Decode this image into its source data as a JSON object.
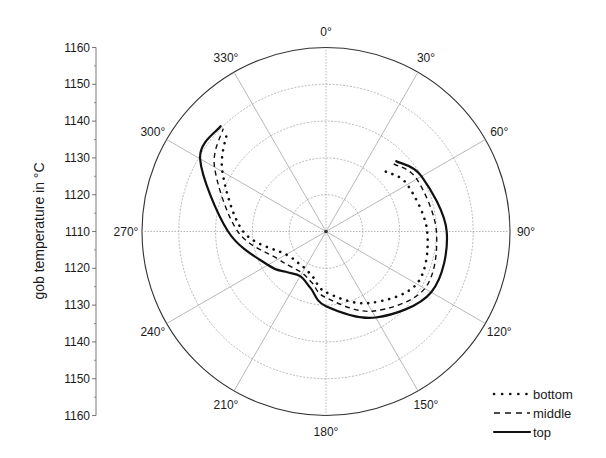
{
  "chart_data": {
    "type": "polar-line",
    "title": "",
    "ylabel": "gob temperature in °C",
    "radial_axis": {
      "center_value": 1110,
      "outer_value": 1160,
      "ticks": [
        1110,
        1120,
        1130,
        1140,
        1150,
        1160
      ],
      "left_axis_labels_top_to_bottom": [
        "1160",
        "1150",
        "1140",
        "1130",
        "1120",
        "1110",
        "1120",
        "1130",
        "1140",
        "1150",
        "1160"
      ]
    },
    "angular_axis": {
      "direction": "clockwise",
      "zero": "top",
      "labels": [
        "0°",
        "30°",
        "60°",
        "90°",
        "120°",
        "150°",
        "180°",
        "210°",
        "240°",
        "270°",
        "300°",
        "330°"
      ],
      "angles": [
        0,
        30,
        60,
        90,
        120,
        150,
        180,
        210,
        240,
        270,
        300,
        330
      ]
    },
    "grid": true,
    "legend_position": "lower right",
    "series": [
      {
        "name": "bottom",
        "style": "dotted",
        "angles": [
          45,
          60,
          90,
          120,
          150,
          180,
          195,
          210,
          225,
          240,
          270,
          300,
          315
        ],
        "values": [
          1133,
          1135.5,
          1137.5,
          1138.5,
          1132.5,
          1126.5,
          1123,
          1121.5,
          1121.5,
          1122.5,
          1132.5,
          1142.5,
          1148
        ]
      },
      {
        "name": "middle",
        "style": "dashed",
        "angles": [
          45,
          60,
          90,
          120,
          150,
          180,
          195,
          210,
          225,
          240,
          270,
          300,
          315
        ],
        "values": [
          1136,
          1138.5,
          1140,
          1141,
          1135,
          1128,
          1124.5,
          1123,
          1123.5,
          1125,
          1134,
          1145,
          1149.5
        ]
      },
      {
        "name": "top",
        "style": "solid",
        "angles": [
          45,
          60,
          90,
          120,
          150,
          180,
          195,
          210,
          225,
          240,
          270,
          300,
          315
        ],
        "values": [
          1137,
          1140,
          1142.8,
          1143,
          1137,
          1130.3,
          1126,
          1124,
          1125.5,
          1128.2,
          1136.6,
          1149.5,
          1150.5
        ]
      }
    ]
  },
  "legend": {
    "items": [
      {
        "label": "bottom",
        "style": "dotted"
      },
      {
        "label": "middle",
        "style": "dashed"
      },
      {
        "label": "top",
        "style": "solid"
      }
    ]
  }
}
